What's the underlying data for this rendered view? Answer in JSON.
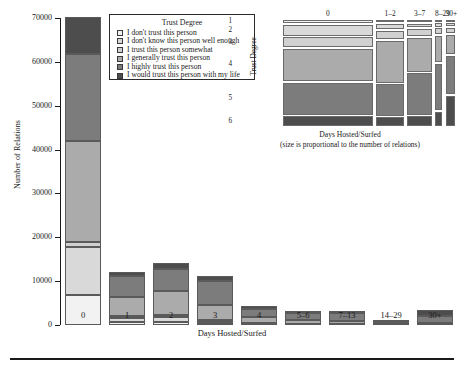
{
  "chart_data": [
    {
      "type": "bar",
      "id": "stacked-bar-main",
      "title": "",
      "xlabel": "Days Hosted/Surfed",
      "ylabel": "Number of Relations",
      "ylim": [
        0,
        70000
      ],
      "yticks": [
        0,
        10000,
        20000,
        30000,
        40000,
        50000,
        60000,
        70000
      ],
      "ytick_labels": [
        "0",
        "10000",
        "20000",
        "30000",
        "40000",
        "50000",
        "60000",
        "70000"
      ],
      "grid": false,
      "stacked": true,
      "stack_order": "bottom-to-top",
      "categories": [
        "0",
        "1",
        "2",
        "3",
        "4",
        "5–6",
        "7–13",
        "14–29",
        "30+"
      ],
      "series": [
        {
          "name": "I don't trust this person",
          "level": 1,
          "color": "#f2f2f2",
          "values": [
            6900,
            600,
            700,
            350,
            130,
            100,
            70,
            20,
            40
          ]
        },
        {
          "name": "I don't know this person well enough",
          "level": 2,
          "color": "#d9d9d9",
          "values": [
            11000,
            1100,
            1100,
            550,
            200,
            150,
            110,
            30,
            60
          ]
        },
        {
          "name": "I trust this person somewhat",
          "level": 3,
          "color": "#d0d0d0",
          "values": [
            1000,
            400,
            400,
            250,
            100,
            80,
            60,
            15,
            30
          ]
        },
        {
          "name": "I generally trust this person",
          "level": 4,
          "color": "#ababab",
          "values": [
            23000,
            4400,
            5500,
            3400,
            1300,
            900,
            600,
            130,
            300
          ]
        },
        {
          "name": "I highly trust this person",
          "level": 5,
          "color": "#7c7c7c",
          "values": [
            20000,
            4600,
            5000,
            5600,
            2000,
            1600,
            1800,
            400,
            1700
          ]
        },
        {
          "name": "I would trust this person with my life",
          "level": 6,
          "color": "#4d4d4d",
          "values": [
            8300,
            1000,
            1400,
            1100,
            500,
            400,
            450,
            120,
            1200
          ]
        }
      ],
      "totals": [
        70200,
        12100,
        14100,
        11250,
        4230,
        3230,
        3090,
        715,
        3330
      ]
    },
    {
      "type": "heatmap",
      "id": "mosaic-plot",
      "subtype": "mosaic",
      "xlabel": "Days Hosted/Surfed",
      "xnote": "(size is proportional to the number of relations)",
      "ylabel": "Trust Degree",
      "columns": [
        "0",
        "1–2",
        "3–7",
        "8–29",
        "30+"
      ],
      "column_widths": [
        0.565,
        0.175,
        0.155,
        0.046,
        0.059
      ],
      "rows": [
        "1",
        "2",
        "3",
        "4",
        "5",
        "6"
      ],
      "row_colors": [
        "#f2f2f2",
        "#d9d9d9",
        "#d0d0d0",
        "#ababab",
        "#7c7c7c",
        "#4d4d4d"
      ],
      "cells": [
        {
          "column": "0",
          "proportions": [
            0.033,
            0.112,
            0.098,
            0.33,
            0.33,
            0.097
          ]
        },
        {
          "column": "1–2",
          "proportions": [
            0.022,
            0.055,
            0.085,
            0.43,
            0.32,
            0.088
          ]
        },
        {
          "column": "3–7",
          "proportions": [
            0.02,
            0.04,
            0.07,
            0.35,
            0.42,
            0.1
          ]
        },
        {
          "column": "8–29",
          "proportions": [
            0.018,
            0.035,
            0.06,
            0.27,
            0.47,
            0.147
          ]
        },
        {
          "column": "30+",
          "proportions": [
            0.015,
            0.03,
            0.055,
            0.2,
            0.39,
            0.31
          ]
        }
      ]
    }
  ],
  "legend": {
    "title": "Trust Degree",
    "position": "inside-top-left",
    "entries": [
      {
        "label": "I don't trust this person",
        "color": "#f2f2f2"
      },
      {
        "label": "I don't know this person well enough",
        "color": "#d9d9d9"
      },
      {
        "label": "I trust this person somewhat",
        "color": "#d0d0d0"
      },
      {
        "label": "I generally trust this person",
        "color": "#ababab"
      },
      {
        "label": "I highly trust this person",
        "color": "#7c7c7c"
      },
      {
        "label": "I would trust this person with my life",
        "color": "#4d4d4d"
      }
    ]
  },
  "colors": {
    "axis": "#1a1a1a",
    "segment_border": "#5a5a5a",
    "background": "#ffffff",
    "rule": "#1a1a1a"
  }
}
